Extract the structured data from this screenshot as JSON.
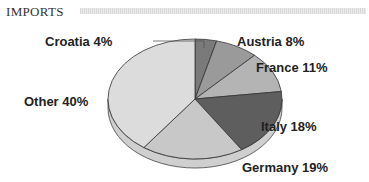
{
  "chart_data": {
    "type": "pie",
    "title": "IMPORTS",
    "categories": [
      "Croatia",
      "Austria",
      "France",
      "Italy",
      "Germany",
      "Other"
    ],
    "values": [
      4,
      8,
      11,
      18,
      19,
      40
    ],
    "unit": "%",
    "labels": [
      "Croatia 4%",
      "Austria 8%",
      "France 11%",
      "Italy 18%",
      "Germany 19%",
      "Other 40%"
    ],
    "colors": [
      "#7a7a7a",
      "#9a9a9a",
      "#b4b4b4",
      "#5e5e5e",
      "#c8c8c8",
      "#dcdcdc"
    ],
    "style": "3d-pie",
    "legend": "none",
    "start_angle": "12 o'clock, clockwise"
  }
}
